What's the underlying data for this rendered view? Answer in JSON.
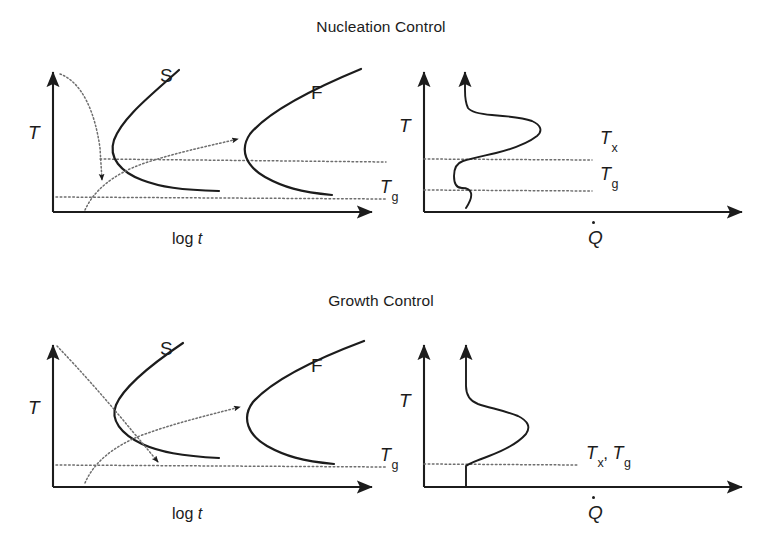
{
  "figure": {
    "width": 762,
    "height": 551,
    "background": "#ffffff",
    "ink_color": "#1c1c1c",
    "dotted_color": "#6e6e6e"
  },
  "panels": [
    {
      "id": "nucleation",
      "title": "Nucleation Control",
      "title_x": 375,
      "title_y": 26,
      "left_plot": {
        "kind": "ttt-diagram",
        "y_axis_label": "T",
        "x_axis_label": "log t",
        "x_axis_label_italic_part": "t",
        "curves": [
          {
            "name": "S",
            "label": "S",
            "label_x": 163,
            "label_y": 76
          },
          {
            "name": "F",
            "label": "F",
            "label_x": 312,
            "label_y": 93
          }
        ],
        "horizontal_lines": [
          {
            "name": "Tx-line",
            "label": "",
            "level": "upper"
          },
          {
            "name": "Tg-line",
            "label": "Tg",
            "label_base": "T",
            "label_sub": "g",
            "level": "lower"
          }
        ],
        "annotations": [
          {
            "name": "cooling-path",
            "style": "dotted-arrow",
            "direction": "down"
          },
          {
            "name": "heating-path",
            "style": "dotted-arrow",
            "direction": "up-right"
          }
        ]
      },
      "right_plot": {
        "kind": "dsc-trace",
        "y_axis_label": "T",
        "x_axis_label": "Q",
        "x_axis_label_dot": true,
        "features": [
          {
            "name": "crystallization-peak",
            "label_base": "T",
            "label_sub": "x",
            "label_x": 602,
            "label_y": 137
          },
          {
            "name": "glass-transition-step",
            "label_base": "T",
            "label_sub": "g",
            "label_x": 602,
            "label_y": 172
          }
        ],
        "separate_tx_tg": true
      }
    },
    {
      "id": "growth",
      "title": "Growth Control",
      "title_x": 375,
      "title_y": 300,
      "left_plot": {
        "kind": "ttt-diagram",
        "y_axis_label": "T",
        "x_axis_label": "log t",
        "x_axis_label_italic_part": "t",
        "curves": [
          {
            "name": "S",
            "label": "S",
            "label_x": 163,
            "label_y": 349
          },
          {
            "name": "F",
            "label": "F",
            "label_x": 312,
            "label_y": 366
          }
        ],
        "horizontal_lines": [
          {
            "name": "Tg-line",
            "label": "Tg",
            "label_base": "T",
            "label_sub": "g",
            "level": "lower"
          }
        ],
        "annotations": [
          {
            "name": "cooling-path",
            "style": "dotted-arrow",
            "direction": "down-right"
          },
          {
            "name": "heating-path",
            "style": "dotted-arrow",
            "direction": "up-right"
          }
        ]
      },
      "right_plot": {
        "kind": "dsc-trace",
        "y_axis_label": "T",
        "x_axis_label": "Q",
        "x_axis_label_dot": true,
        "features": [
          {
            "name": "combined-peak",
            "label_base": "T",
            "label_sub": "x",
            "label_base2": "T",
            "label_sub2": "g",
            "label_x": 588,
            "label_y": 452
          }
        ],
        "separate_tx_tg": false
      }
    }
  ],
  "labels": {
    "temperature": "T",
    "log_time": "log ",
    "log_time_italic": "t",
    "heat_flow": "Q",
    "slow_curve": "S",
    "fast_curve": "F",
    "t_base": "T",
    "tx_sub": "x",
    "tg_sub": "g",
    "comma": ","
  }
}
